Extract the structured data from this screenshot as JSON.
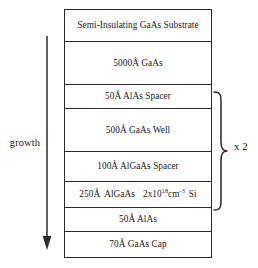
{
  "diagram": {
    "growth": {
      "label": "growth",
      "direction": "down",
      "arrow_icon": "arrow-down-icon"
    },
    "repeat": {
      "label": "x 2",
      "brace_icon": "curly-brace-right-icon",
      "spans_layers": [
        2,
        3,
        4,
        5
      ]
    },
    "colors": {
      "stroke": "#2b2b2b",
      "text": "#1a1a1a",
      "background": "#ffffff"
    },
    "layers": [
      {
        "id": "substrate",
        "label": "Semi-Insulating GaAs Substrate",
        "height_px": 32,
        "material": "GaAs",
        "thickness": "",
        "role": "Substrate"
      },
      {
        "id": "buffer-gaas",
        "label": "5000Å GaAs",
        "height_px": 43,
        "material": "GaAs",
        "thickness": "5000Å",
        "role": "Buffer"
      },
      {
        "id": "alas-spacer",
        "label": "50Å AlAs Spacer",
        "height_px": 24,
        "material": "AlAs",
        "thickness": "50Å",
        "role": "Spacer"
      },
      {
        "id": "gaas-well",
        "label": "500Å GaAs Well",
        "height_px": 43,
        "material": "GaAs",
        "thickness": "500Å",
        "role": "Well"
      },
      {
        "id": "algaas-spacer",
        "label": "100Å AlGaAs Spacer",
        "height_px": 30,
        "material": "AlGaAs",
        "thickness": "100Å",
        "role": "Spacer"
      },
      {
        "id": "algaas-doped",
        "label_rich": true,
        "thickness": "250Å",
        "material": "AlGaAs",
        "doping_value": "2x10",
        "doping_exponent": "18",
        "doping_unit": "cm",
        "doping_unit_exponent": "-3",
        "dopant": "Si",
        "height_px": 26,
        "role": "Doped layer"
      },
      {
        "id": "alas",
        "label": "50Å AlAs",
        "height_px": 24,
        "material": "AlAs",
        "thickness": "50Å",
        "role": "Barrier"
      },
      {
        "id": "gaas-cap",
        "label": "70Å GaAs Cap",
        "height_px": 25,
        "material": "GaAs",
        "thickness": "70Å",
        "role": "Cap"
      }
    ]
  }
}
